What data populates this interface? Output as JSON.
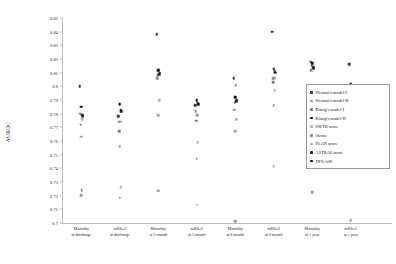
{
  "chart_data": {
    "type": "scatter",
    "title": "",
    "xlabel": "",
    "ylabel": "AUROC",
    "ylim": [
      0.7,
      0.85
    ],
    "yticks": [
      "0.85",
      "0.84",
      "0.83",
      "0.82",
      "0.81",
      "0.8",
      "0.79",
      "0.78",
      "0.77",
      "0.76",
      "0.75",
      "0.74",
      "0.73",
      "0.72",
      "0.71",
      "0.7"
    ],
    "ytick_values": [
      0.85,
      0.84,
      0.83,
      0.82,
      0.81,
      0.8,
      0.79,
      0.78,
      0.77,
      0.76,
      0.75,
      0.74,
      0.73,
      0.72,
      0.71,
      0.7
    ],
    "grid": false,
    "legend_position": "right",
    "categories": [
      {
        "line1": "Mortality",
        "line2": "at discharge"
      },
      {
        "line1": "mRS≥2",
        "line2": "at discharge"
      },
      {
        "line1": "Mortality",
        "line2": "at 3 month"
      },
      {
        "line1": "mRS≥2",
        "line2": "at 3 month"
      },
      {
        "line1": "Mortality",
        "line2": "at 6 month"
      },
      {
        "line1": "mRS≥2",
        "line2": "at 6 month"
      },
      {
        "line1": "Mortality",
        "line2": "at 1 year"
      },
      {
        "line1": "mRS≥2",
        "line2": "at 1 year"
      }
    ],
    "series": [
      {
        "name": "Weimar's model-I",
        "color": "#3d3d3d",
        "values": [
          0.8,
          0.778,
          0.838,
          0.786,
          0.806,
          0.84,
          0.818,
          0.816
        ]
      },
      {
        "name": "Weimar's model-II",
        "color": "#9a9a9a",
        "values": [
          0.724,
          0.774,
          0.812,
          0.779,
          0.801,
          0.806,
          0.8,
          0.801
        ]
      },
      {
        "name": "König's model-I",
        "color": "#7a7a7a",
        "values": [
          0.772,
          0.767,
          0.808,
          0.775,
          0.788,
          0.803,
          0.815,
          0.798
        ]
      },
      {
        "name": "König's model-II",
        "color": "#1a1a1a",
        "values": [
          0.778,
          0.782,
          0.81,
          0.787,
          0.79,
          0.81,
          0.813,
          0.8
        ]
      },
      {
        "name": "SWTB score",
        "color": "#b5b5b5",
        "values": [
          0.776,
          0.726,
          0.79,
          0.759,
          0.776,
          0.797,
          0.8,
          0.794
        ]
      },
      {
        "name": "iScore",
        "color": "#8c8c8c",
        "values": [
          0.78,
          0.774,
          0.806,
          0.782,
          0.783,
          0.806,
          0.812,
          0.798
        ]
      },
      {
        "name": "PLAN score",
        "color": "#a5a5a5",
        "values": [
          0.763,
          0.756,
          0.779,
          0.747,
          0.767,
          0.786,
          0.782,
          0.786
        ]
      },
      {
        "name": "ASTRAL score",
        "color": "#2a2a2a",
        "values": [
          0.779,
          0.783,
          0.809,
          0.788,
          0.789,
          0.811,
          0.814,
          0.799
        ]
      },
      {
        "name": "DFS-AIS",
        "color": "#111111",
        "values": [
          0.785,
          0.787,
          0.812,
          0.79,
          0.792,
          0.813,
          0.817,
          0.802
        ]
      }
    ],
    "extra_low_points": [
      {
        "category_index": 0,
        "value": 0.7205,
        "color": "#9a9a9a"
      },
      {
        "category_index": 1,
        "value": 0.7185,
        "color": "#a5a5a5"
      },
      {
        "category_index": 2,
        "value": 0.7235,
        "color": "#8c8c8c"
      },
      {
        "category_index": 3,
        "value": 0.7135,
        "color": "#b5b5b5"
      },
      {
        "category_index": 4,
        "value": 0.7015,
        "color": "#9a9a9a"
      },
      {
        "category_index": 5,
        "value": 0.7415,
        "color": "#b5b5b5"
      },
      {
        "category_index": 6,
        "value": 0.7225,
        "color": "#9a9a9a"
      },
      {
        "category_index": 7,
        "value": 0.702,
        "color": "#a5a5a5"
      }
    ]
  }
}
